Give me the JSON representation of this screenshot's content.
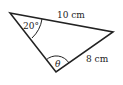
{
  "diagram": {
    "type": "triangle",
    "stroke_color": "#222222",
    "vertices": {
      "top_left": [
        10,
        13
      ],
      "right": [
        113,
        32
      ],
      "bottom": [
        56,
        72
      ]
    },
    "labels": {
      "top_side": "10 cm",
      "right_side": "8 cm",
      "top_left_angle": "20°",
      "bottom_angle": "θ"
    }
  }
}
